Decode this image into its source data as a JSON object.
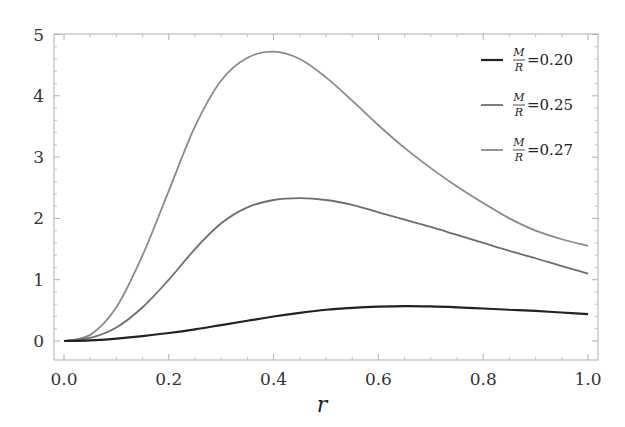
{
  "chart_data": {
    "type": "line",
    "title": "",
    "xlabel": "r",
    "ylabel": "",
    "xlim": [
      0.0,
      1.0
    ],
    "ylim": [
      -0.2,
      5.0
    ],
    "grid": false,
    "legend_position": "upper right",
    "x_ticks": [
      "0.0",
      "0.2",
      "0.4",
      "0.6",
      "0.8",
      "1.0"
    ],
    "y_ticks": [
      "0",
      "1",
      "2",
      "3",
      "4",
      "5"
    ],
    "x": [
      0.0,
      0.05,
      0.1,
      0.15,
      0.2,
      0.25,
      0.3,
      0.35,
      0.4,
      0.45,
      0.5,
      0.55,
      0.6,
      0.65,
      0.7,
      0.75,
      0.8,
      0.85,
      0.9,
      0.95,
      1.0
    ],
    "series": [
      {
        "name": "M/R=0.20",
        "label_num": "M",
        "label_den": "R",
        "label_value": "=0.20",
        "color": "#222222",
        "width": 2.2,
        "values": [
          0.0,
          0.01,
          0.04,
          0.08,
          0.13,
          0.19,
          0.26,
          0.33,
          0.4,
          0.46,
          0.51,
          0.54,
          0.56,
          0.57,
          0.565,
          0.55,
          0.53,
          0.51,
          0.49,
          0.465,
          0.44
        ]
      },
      {
        "name": "M/R=0.25",
        "label_num": "M",
        "label_den": "R",
        "label_value": "=0.25",
        "color": "#6e6e6e",
        "width": 1.8,
        "values": [
          0.0,
          0.05,
          0.22,
          0.55,
          1.0,
          1.5,
          1.92,
          2.18,
          2.3,
          2.33,
          2.3,
          2.22,
          2.1,
          1.98,
          1.86,
          1.73,
          1.6,
          1.47,
          1.35,
          1.22,
          1.1
        ]
      },
      {
        "name": "M/R=0.27",
        "label_num": "M",
        "label_den": "R",
        "label_value": "=0.27",
        "color": "#8a8a8a",
        "width": 1.8,
        "values": [
          0.0,
          0.1,
          0.55,
          1.4,
          2.45,
          3.5,
          4.25,
          4.62,
          4.72,
          4.6,
          4.3,
          3.92,
          3.52,
          3.15,
          2.82,
          2.52,
          2.25,
          2.0,
          1.8,
          1.66,
          1.55
        ]
      }
    ]
  }
}
